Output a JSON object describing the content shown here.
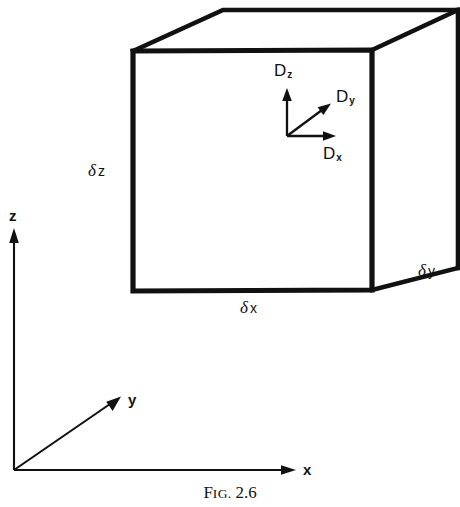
{
  "figure": {
    "caption": {
      "prefix_first_letter": "F",
      "prefix_small_caps": "IG.",
      "number": "2.6",
      "full_text": "FIG. 2.6"
    },
    "cube": {
      "name": "differential-volume-element",
      "edge_labels": {
        "width": {
          "delta": "δ",
          "variable": "x",
          "full": "δ x"
        },
        "depth": {
          "delta": "δ",
          "variable": "y",
          "full": "δ y"
        },
        "height": {
          "delta": "δ",
          "variable": "z",
          "full": "δ z"
        }
      }
    },
    "flux_vectors": [
      {
        "name": "D-z-vector",
        "symbol": "D",
        "subscript": "z",
        "label": "Dz",
        "direction": "up"
      },
      {
        "name": "D-y-vector",
        "symbol": "D",
        "subscript": "y",
        "label": "Dy",
        "direction": "up-right-diagonal"
      },
      {
        "name": "D-x-vector",
        "symbol": "D",
        "subscript": "x",
        "label": "Dx",
        "direction": "right"
      }
    ],
    "coordinate_axes": [
      {
        "name": "z-axis",
        "label": "z",
        "direction": "up"
      },
      {
        "name": "y-axis",
        "label": "y",
        "direction": "up-right-diagonal"
      },
      {
        "name": "x-axis",
        "label": "x",
        "direction": "right"
      }
    ],
    "colors": {
      "ink": "#111111",
      "background": "#ffffff"
    }
  }
}
